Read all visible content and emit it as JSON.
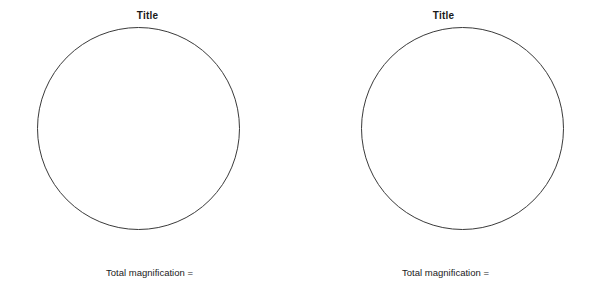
{
  "page": {
    "background_color": "#ffffff",
    "circle_stroke_color": "#3a3a3a",
    "text_color": "#1a1a1a"
  },
  "panels": [
    {
      "title": "Title",
      "circle_label": "field-of-view-circle",
      "caption": "Total magnification ="
    },
    {
      "title": "Title",
      "circle_label": "field-of-view-circle",
      "caption": "Total magnification ="
    }
  ]
}
